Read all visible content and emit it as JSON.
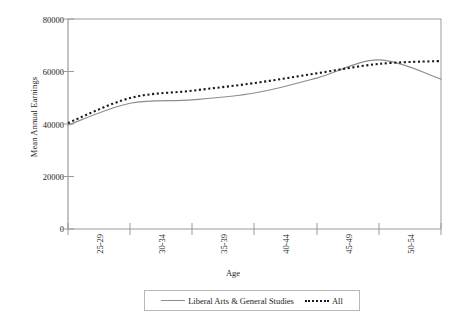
{
  "chart_data": {
    "type": "line",
    "title": "",
    "xlabel": "Age",
    "ylabel": "Mean Annual Earnings",
    "categories": [
      "25-29",
      "30-34",
      "35-39",
      "40-44",
      "45-49",
      "50-54",
      "55-59"
    ],
    "ylim": [
      0,
      80000
    ],
    "yticks": [
      0,
      20000,
      40000,
      60000,
      80000
    ],
    "ytick_labels": [
      "0",
      "20000",
      "40000",
      "60000",
      "80000"
    ],
    "grid": false,
    "legend_position": "bottom",
    "series": [
      {
        "name": "Liberal Arts & General Studies",
        "style": "solid",
        "color": "#8d8d8d",
        "values": [
          39600,
          47900,
          49200,
          51800,
          57500,
          64400,
          57100
        ]
      },
      {
        "name": "All",
        "style": "dotted",
        "color": "#1a1a1a",
        "values": [
          40400,
          49900,
          52700,
          55600,
          59300,
          62900,
          64000
        ]
      }
    ]
  },
  "axes": {
    "y_title": "Mean Annual Earnings",
    "x_title": "Age",
    "y_tick_labels": [
      "80000",
      "60000",
      "40000",
      "20000",
      "0"
    ],
    "x_tick_labels": [
      "25-29",
      "30-34",
      "35-39",
      "40-44",
      "45-49",
      "50-54",
      "55-59"
    ]
  },
  "legend": {
    "items": [
      {
        "label": "Liberal Arts & General Studies",
        "marker": "solid-line-swatch"
      },
      {
        "label": "All",
        "marker": "dotted-line-swatch"
      }
    ]
  },
  "colors": {
    "series_liberal_arts": "#8d8d8d",
    "series_all": "#1a1a1a",
    "axis": "#9a9a9a",
    "text": "#1c1c1c",
    "background": "#ffffff"
  }
}
